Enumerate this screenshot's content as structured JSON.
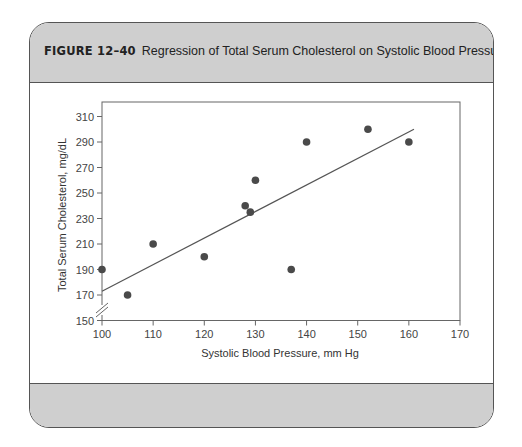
{
  "figure": {
    "number": "FIGURE 12–40",
    "title": "Regression of Total Serum Cholesterol on Systolic Blood Pressure"
  },
  "colors": {
    "header_bg": "#cfcfcf",
    "border": "#555555",
    "point": "#4a4a4a",
    "line": "#555555"
  },
  "chart_data": {
    "type": "scatter",
    "title": "Regression of Total Serum Cholesterol on Systolic Blood Pressure",
    "xlabel": "Systolic Blood Pressure, mm Hg",
    "ylabel": "Total Serum Cholesterol, mg/dL",
    "xlim": [
      100,
      170
    ],
    "ylim": [
      150,
      310
    ],
    "xticks": [
      100,
      110,
      120,
      130,
      140,
      150,
      160,
      170
    ],
    "yticks": [
      150,
      170,
      190,
      210,
      230,
      250,
      270,
      290,
      310
    ],
    "axis_break": "y-axis break between 150 and 170",
    "grid": false,
    "legend": null,
    "points": [
      {
        "x": 100,
        "y": 190
      },
      {
        "x": 105,
        "y": 170
      },
      {
        "x": 110,
        "y": 210
      },
      {
        "x": 120,
        "y": 200
      },
      {
        "x": 128,
        "y": 240
      },
      {
        "x": 129,
        "y": 235
      },
      {
        "x": 130,
        "y": 260
      },
      {
        "x": 137,
        "y": 190
      },
      {
        "x": 140,
        "y": 290
      },
      {
        "x": 152,
        "y": 300
      },
      {
        "x": 160,
        "y": 290
      }
    ],
    "regression_line": {
      "x": [
        100,
        161
      ],
      "y": [
        173,
        300
      ]
    }
  }
}
